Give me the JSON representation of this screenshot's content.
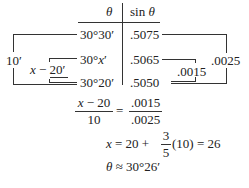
{
  "table": {
    "header": {
      "theta": "θ",
      "sin_theta": "sin θ"
    },
    "rows": [
      {
        "theta": "30°30′",
        "sin": ".5075"
      },
      {
        "theta": "30°x′",
        "sin": ".5065"
      },
      {
        "theta": "30°20′",
        "sin": ".5050"
      }
    ],
    "left_brackets": {
      "outer": "10′",
      "inner": "x − 20′"
    },
    "right_brackets": {
      "outer": ".0025",
      "inner": ".0015"
    }
  },
  "equations": {
    "eq1": {
      "lhs_num": "x − 20",
      "lhs_den": "10",
      "eq": "=",
      "rhs_num": ".0015",
      "rhs_den": ".0025"
    },
    "eq2": {
      "lhs": "x = 20 +",
      "frac_num": "3",
      "frac_den": "5",
      "rhs": "(10) = 26"
    },
    "eq3": {
      "text": "θ ≈ 30°26′"
    }
  }
}
